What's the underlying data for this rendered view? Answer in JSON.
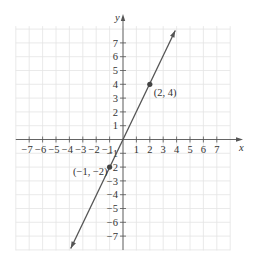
{
  "chart_data": {
    "type": "line",
    "title": "",
    "xlabel": "x",
    "ylabel": "y",
    "xlim": [
      -8,
      8
    ],
    "ylim": [
      -8,
      8
    ],
    "grid": true,
    "x_ticks": [
      -7,
      -6,
      -5,
      -4,
      -3,
      -2,
      -1,
      1,
      2,
      3,
      4,
      5,
      6,
      7
    ],
    "y_ticks": [
      7,
      6,
      5,
      4,
      3,
      2,
      1,
      -1,
      -2,
      -3,
      -4,
      -5,
      -6,
      -7
    ],
    "x_tick_labels": [
      "−7",
      "−6",
      "−5",
      "−4",
      "−3",
      "−2",
      "−1",
      "1",
      "2",
      "3",
      "4",
      "5",
      "6",
      "7"
    ],
    "y_tick_labels": [
      "7",
      "6",
      "5",
      "4",
      "3",
      "2",
      "1",
      "−1",
      "−2",
      "−3",
      "−4",
      "−5",
      "−6",
      "−7"
    ],
    "series": [
      {
        "name": "y = 2x",
        "equation": "y = 2x",
        "x": [
          -3.9,
          3.9
        ],
        "y": [
          -7.9,
          7.9
        ],
        "arrows": "both",
        "color": "#555555"
      }
    ],
    "points": [
      {
        "x": 2,
        "y": 4,
        "label": "(2, 4)"
      },
      {
        "x": -1,
        "y": -2,
        "label": "(−1, −2)"
      }
    ],
    "annotations": [
      "(2, 4)",
      "(−1, −2)"
    ],
    "legend": null
  },
  "colors": {
    "grid": "#e4e4e4",
    "axis": "#555555",
    "line": "#555555",
    "point": "#444444",
    "text": "#333333"
  }
}
